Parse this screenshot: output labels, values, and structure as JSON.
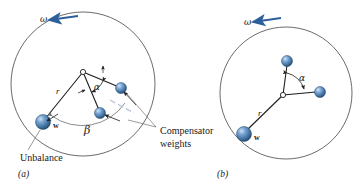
{
  "figure": {
    "colors": {
      "sphere_fill": "#4a7ebb",
      "sphere_highlight": "#b9d0e8",
      "sphere_shadow": "#2f5f94",
      "sphere_stroke": "#1f4068",
      "outline": "#5a5a5a",
      "leader": "#6e6e6e",
      "arrow_blue": "#2d5f9a",
      "text": "#1a1a1a",
      "background": "#ffffff"
    },
    "panels": [
      {
        "id": "a",
        "caption": "(a)",
        "omega_label": "ω",
        "radius_label": "r",
        "unbalance_weight_label": "w",
        "unbalance_callout": "Unbalance",
        "compensator_callout_line1": "Compensator",
        "compensator_callout_line2": "weights",
        "angle_alpha_label": "α",
        "angle_beta_label": "β",
        "circle": {
          "cx": 83,
          "cy": 84,
          "r": 72
        },
        "hub": {
          "x": 83,
          "y": 72
        },
        "unbalance_weight": {
          "x": 43,
          "y": 122,
          "r": 7.5
        },
        "compensator_weights": [
          {
            "x": 121,
            "y": 88,
            "r": 5.5
          },
          {
            "x": 100,
            "y": 113,
            "r": 5.5
          }
        ]
      },
      {
        "id": "b",
        "caption": "(b)",
        "omega_label": "ω",
        "radius_label": "r",
        "unbalance_weight_label": "w",
        "angle_alpha_label": "α",
        "circle": {
          "cx": 286,
          "cy": 93,
          "r": 66
        },
        "hub": {
          "x": 283,
          "y": 95
        },
        "unbalance_weight": {
          "x": 244,
          "y": 134,
          "r": 7.5
        },
        "compensator_weights": [
          {
            "x": 287,
            "y": 61,
            "r": 5.5
          },
          {
            "x": 320,
            "y": 92,
            "r": 5.5
          }
        ]
      }
    ]
  }
}
